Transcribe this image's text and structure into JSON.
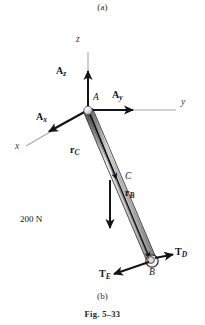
{
  "figure": {
    "caption_top": "(a)",
    "caption_bottom": "(b)",
    "figure_number": "Fig. 5–33",
    "width": 205,
    "height": 325,
    "background_color": "#ffffff"
  },
  "colors": {
    "ink": "#141414",
    "axis_gray": "#9a9a9a",
    "rod_light": "#e9e9e9",
    "rod_mid": "#c2c2c2",
    "rod_dark": "#6f6f6f",
    "joint_fill": "#efefef"
  },
  "axes": [
    {
      "name": "z-axis",
      "label": "z",
      "label_x": 79,
      "label_y": 40,
      "from_x": 88,
      "from_y": 110,
      "to_x": 88,
      "to_y": 52
    },
    {
      "name": "y-axis",
      "label": "y",
      "label_x": 183,
      "label_y": 103,
      "from_x": 88,
      "from_y": 110,
      "to_x": 176,
      "to_y": 110
    },
    {
      "name": "x-axis",
      "label": "x",
      "label_x": 17,
      "label_y": 148,
      "from_x": 88,
      "from_y": 110,
      "to_x": 26,
      "to_y": 146
    }
  ],
  "points": [
    {
      "name": "A",
      "label": "A",
      "x": 88,
      "y": 110,
      "label_x": 93,
      "label_y": 98,
      "type": "ball-and-socket"
    },
    {
      "name": "C",
      "label": "C",
      "x": 118,
      "y": 181,
      "label_x": 126,
      "label_y": 176,
      "type": "point"
    },
    {
      "name": "B",
      "label": "B",
      "x": 152,
      "y": 262,
      "label_x": 150,
      "label_y": 271,
      "type": "collar"
    }
  ],
  "rod": {
    "name": "pipe-assembly",
    "from_x": 88,
    "from_y": 110,
    "to_x": 152,
    "to_y": 262,
    "width": 9
  },
  "reaction_forces": [
    {
      "name": "A_z",
      "symbol": "A",
      "subscript": "z",
      "label_x": 59,
      "label_y": 72,
      "tail_x": 88,
      "tail_y": 110,
      "tip_x": 88,
      "tip_y": 72
    },
    {
      "name": "A_y",
      "symbol": "A",
      "subscript": "y",
      "label_x": 114,
      "label_y": 96,
      "tail_x": 88,
      "tail_y": 110,
      "tip_x": 133,
      "tip_y": 110
    },
    {
      "name": "A_x",
      "symbol": "A",
      "subscript": "x",
      "label_x": 38,
      "label_y": 117,
      "tail_x": 88,
      "tail_y": 110,
      "tip_x": 48,
      "tip_y": 132
    }
  ],
  "position_vectors": [
    {
      "name": "r_C",
      "symbol": "r",
      "subscript": "C",
      "label_x": 73,
      "label_y": 150,
      "tail_x": 89,
      "tail_y": 112,
      "tip_x": 117,
      "tip_y": 180
    },
    {
      "name": "r_B",
      "symbol": "r",
      "subscript": "B",
      "label_x": 127,
      "label_y": 193,
      "tail_x": 90,
      "tail_y": 114,
      "tip_x": 150,
      "tip_y": 259
    }
  ],
  "applied_load": {
    "name": "applied-load-200N",
    "label": "200 N",
    "label_x": 22,
    "label_y": 220,
    "tail_x": 110,
    "tail_y": 180,
    "tip_x": 110,
    "tip_y": 229
  },
  "cable_tensions": [
    {
      "name": "T_D",
      "symbol": "T",
      "subscript": "D",
      "label_x": 176,
      "label_y": 252,
      "tail_x": 153,
      "tail_y": 258,
      "tip_x": 173,
      "tip_y": 254
    },
    {
      "name": "T_E",
      "symbol": "T",
      "subscript": "E",
      "label_x": 101,
      "label_y": 274,
      "tail_x": 150,
      "tail_y": 261,
      "tip_x": 113,
      "tip_y": 274
    }
  ]
}
